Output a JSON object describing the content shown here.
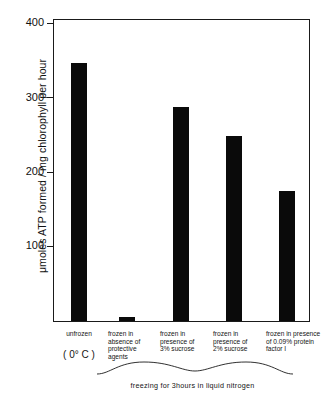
{
  "chart": {
    "type": "bar",
    "y_axis_title": "μmoles ATP formed / mg chlorophyll per hour",
    "y_ticks": [
      "400",
      "300",
      "200",
      "100"
    ],
    "caption": "freezing for 3hours in liquid nitrogen",
    "bar_color": "#0a0a0a",
    "axis_color": "#1a1a1a",
    "categories": [
      {
        "label": "unfrozen",
        "sublabel": "( 0° C )"
      },
      {
        "label": "frozen in absence of protective agents",
        "sublabel": ""
      },
      {
        "label": "frozen in presence of 3% sucrose",
        "sublabel": ""
      },
      {
        "label": "frozen in presence of 2% sucrose",
        "sublabel": ""
      },
      {
        "label": "frozen in presence of 0.09% protein factor I",
        "sublabel": ""
      }
    ]
  },
  "chart_data": {
    "type": "bar",
    "title": "",
    "subtitle": "",
    "xlabel": "freezing for 3hours in liquid nitrogen",
    "ylabel": "μmoles ATP formed / mg chlorophyll per hour",
    "categories": [
      "unfrozen (0° C)",
      "frozen in absence of protective agents",
      "frozen in presence of 3% sucrose",
      "frozen in presence of 2% sucrose",
      "frozen in presence of 0.09% protein factor I"
    ],
    "values": [
      360,
      5,
      298,
      258,
      182
    ],
    "ylim": [
      0,
      420
    ],
    "yticks": [
      100,
      200,
      300,
      400
    ],
    "grid": false,
    "legend": "none",
    "annotations": [
      "freezing for 3hours in liquid nitrogen"
    ]
  }
}
